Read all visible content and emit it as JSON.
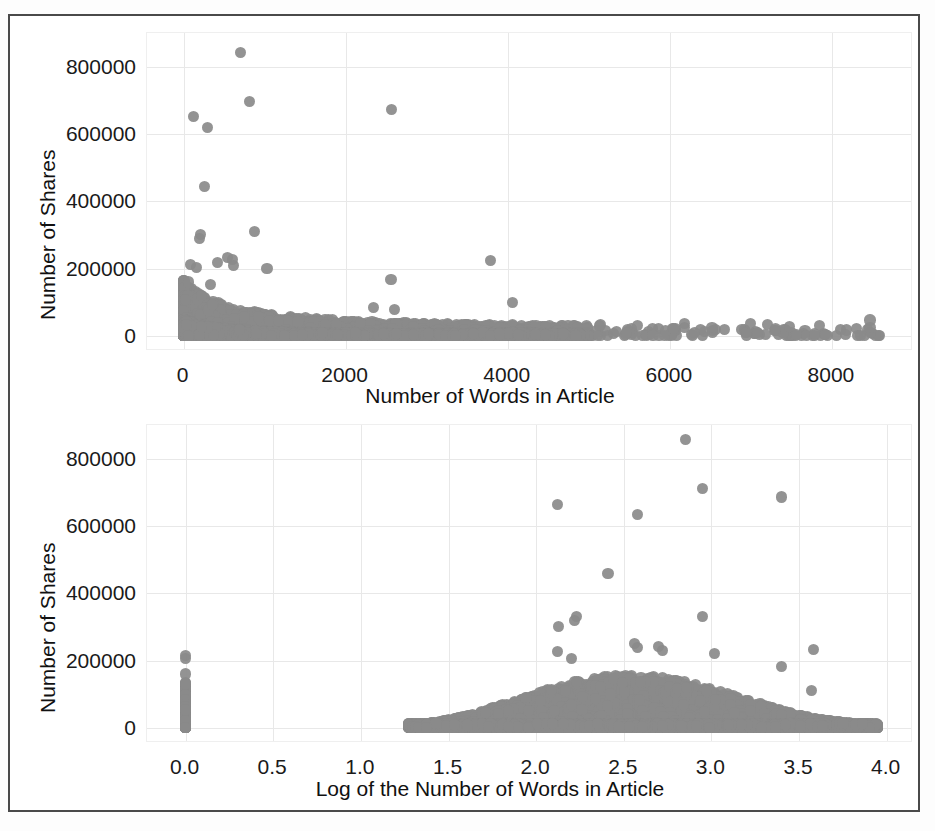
{
  "figure": {
    "border_color": "#4a4a4a",
    "marker_color": "#8a8a8a",
    "grid_color": "#e8e8e8"
  },
  "chart_data": [
    {
      "id": "top",
      "type": "scatter",
      "title": "",
      "xlabel": "Number of Words in Article",
      "ylabel": "Number of Shares",
      "xlim": [
        -450,
        9000
      ],
      "ylim": [
        -45000,
        900000
      ],
      "xticks": [
        0,
        2000,
        4000,
        6000,
        8000
      ],
      "xtick_labels": [
        "0",
        "2000",
        "4000",
        "6000",
        "8000"
      ],
      "yticks": [
        0,
        200000,
        400000,
        600000,
        800000
      ],
      "ytick_labels": [
        "0",
        "200000",
        "400000",
        "600000",
        "800000"
      ],
      "grid": true,
      "legend": "none",
      "outliers": [
        {
          "x": 700,
          "y": 843000
        },
        {
          "x": 820,
          "y": 697000
        },
        {
          "x": 2570,
          "y": 674000
        },
        {
          "x": 120,
          "y": 653000
        },
        {
          "x": 300,
          "y": 620000
        },
        {
          "x": 255,
          "y": 444000
        },
        {
          "x": 875,
          "y": 310000
        },
        {
          "x": 205,
          "y": 300000
        },
        {
          "x": 195,
          "y": 288000
        },
        {
          "x": 3790,
          "y": 225000
        },
        {
          "x": 540,
          "y": 232000
        },
        {
          "x": 600,
          "y": 228000
        },
        {
          "x": 620,
          "y": 210000
        },
        {
          "x": 90,
          "y": 212000
        },
        {
          "x": 160,
          "y": 204000
        },
        {
          "x": 420,
          "y": 218000
        },
        {
          "x": 1030,
          "y": 200000
        },
        {
          "x": 2560,
          "y": 167000
        },
        {
          "x": 4060,
          "y": 100000
        },
        {
          "x": 60,
          "y": 160000
        },
        {
          "x": 330,
          "y": 152000
        },
        {
          "x": 2340,
          "y": 85000
        },
        {
          "x": 2600,
          "y": 78000
        },
        {
          "x": 8470,
          "y": 47000
        }
      ]
    },
    {
      "id": "bottom",
      "type": "scatter",
      "title": "",
      "xlabel": "Log of the Number of Words in Article",
      "ylabel": "Number of Shares",
      "xlim": [
        -0.22,
        4.15
      ],
      "ylim": [
        -45000,
        900000
      ],
      "xticks": [
        0.0,
        0.5,
        1.0,
        1.5,
        2.0,
        2.5,
        3.0,
        3.5,
        4.0
      ],
      "xtick_labels": [
        "0.0",
        "0.5",
        "1.0",
        "1.5",
        "2.0",
        "2.5",
        "3.0",
        "3.5",
        "4.0"
      ],
      "yticks": [
        0,
        200000,
        400000,
        600000,
        800000
      ],
      "ytick_labels": [
        "0",
        "200000",
        "400000",
        "600000",
        "800000"
      ],
      "grid": true,
      "legend": "none",
      "outliers": [
        {
          "x": 2.85,
          "y": 856000
        },
        {
          "x": 2.95,
          "y": 711000
        },
        {
          "x": 3.4,
          "y": 686000
        },
        {
          "x": 2.12,
          "y": 665000
        },
        {
          "x": 2.58,
          "y": 635000
        },
        {
          "x": 2.41,
          "y": 459000
        },
        {
          "x": 2.23,
          "y": 332000
        },
        {
          "x": 2.22,
          "y": 318000
        },
        {
          "x": 2.95,
          "y": 330000
        },
        {
          "x": 2.13,
          "y": 301000
        },
        {
          "x": 2.56,
          "y": 251000
        },
        {
          "x": 2.58,
          "y": 240000
        },
        {
          "x": 2.12,
          "y": 228000
        },
        {
          "x": 2.7,
          "y": 241000
        },
        {
          "x": 2.72,
          "y": 231000
        },
        {
          "x": 3.02,
          "y": 220000
        },
        {
          "x": 3.58,
          "y": 234000
        },
        {
          "x": 2.2,
          "y": 205000
        },
        {
          "x": 3.4,
          "y": 183000
        },
        {
          "x": 3.57,
          "y": 110000
        },
        {
          "x": 0.0,
          "y": 215000
        },
        {
          "x": 0.0,
          "y": 207000
        },
        {
          "x": 0.0,
          "y": 160000
        }
      ],
      "zero_column": {
        "x": 0.0,
        "y_min": 0,
        "y_max": 135000,
        "note": "dense vertical strip of articles with zero words"
      },
      "band_note": "dense arch-shaped band of points from x=1.27 to x=3.95, rising to ~150000 near x=2.1-3.0"
    }
  ]
}
